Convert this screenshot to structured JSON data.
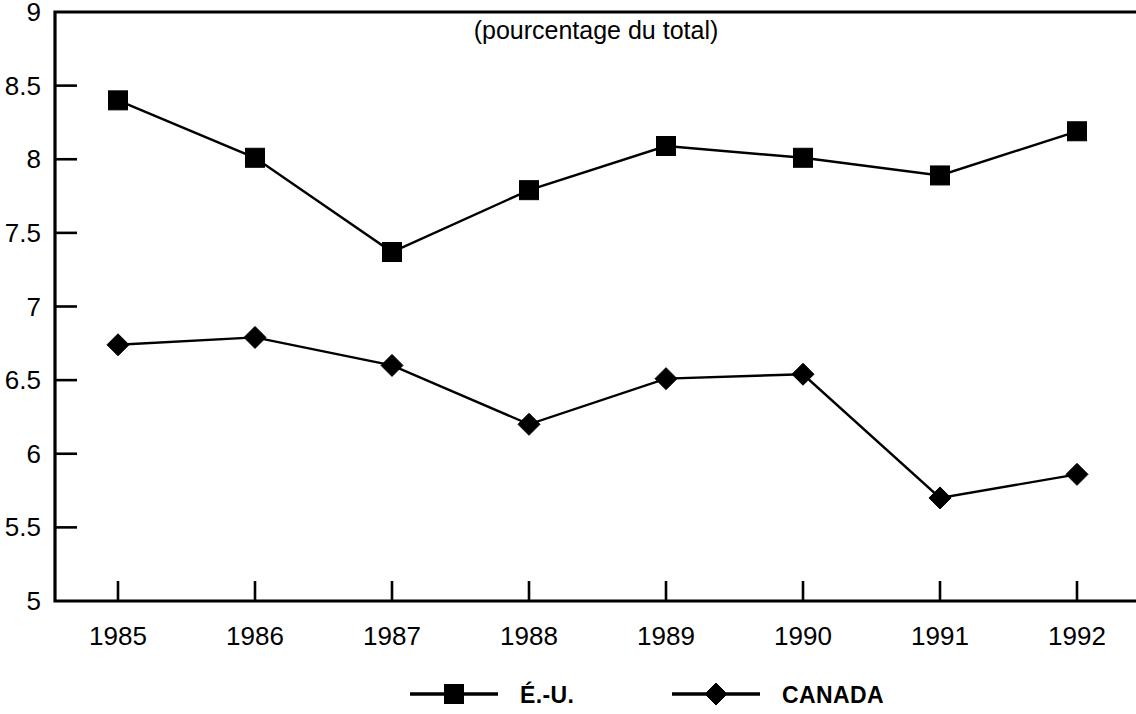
{
  "chart_data": {
    "type": "line",
    "title": "(pourcentage du total)",
    "xlabel": "",
    "ylabel": "",
    "categories": [
      "1985",
      "1986",
      "1987",
      "1988",
      "1989",
      "1990",
      "1991",
      "1992"
    ],
    "series": [
      {
        "name": "É.-U.",
        "marker": "square",
        "color": "#000000",
        "values": [
          8.4,
          8.01,
          7.37,
          7.79,
          8.09,
          8.01,
          7.89,
          8.19
        ]
      },
      {
        "name": "CANADA",
        "marker": "diamond",
        "color": "#000000",
        "values": [
          6.74,
          6.79,
          6.6,
          6.2,
          6.51,
          6.54,
          5.7,
          5.86
        ]
      }
    ],
    "ylim": [
      5,
      9
    ],
    "ytick_values": [
      5,
      5.5,
      6,
      6.5,
      7,
      7.5,
      8,
      8.5,
      9
    ],
    "ytick_labels": [
      "5",
      "5.5",
      "6",
      "6.5",
      "7",
      "7.5",
      "8",
      "8.5",
      "9"
    ],
    "grid": false,
    "legend_position": "bottom"
  },
  "legend": {
    "entries": [
      {
        "label": "É.-U.",
        "marker": "square"
      },
      {
        "label": "CANADA",
        "marker": "diamond"
      }
    ]
  }
}
